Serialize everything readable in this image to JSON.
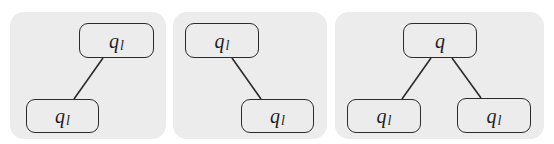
{
  "diagram": {
    "colors": {
      "panel_background": "#ececec",
      "node_border": "#2b2b2b",
      "text": "#1e1e1e"
    },
    "panels": [
      {
        "id": "panel-1",
        "box": {
          "x": 10,
          "y": 12,
          "w": 156,
          "h": 127
        },
        "nodes": [
          {
            "id": "p1-root",
            "base": "q",
            "sub": "l",
            "x": 69,
            "y": 11,
            "w": 75,
            "h": 35
          },
          {
            "id": "p1-child",
            "base": "q",
            "sub": "l",
            "x": 16,
            "y": 87,
            "w": 73,
            "h": 34
          }
        ],
        "edges": [
          {
            "from": "p1-root",
            "to": "p1-child",
            "x1": 93,
            "y1": 46,
            "x2": 64,
            "y2": 87
          }
        ]
      },
      {
        "id": "panel-2",
        "box": {
          "x": 173,
          "y": 12,
          "w": 154,
          "h": 127
        },
        "nodes": [
          {
            "id": "p2-root",
            "base": "q",
            "sub": "l",
            "x": 12,
            "y": 11,
            "w": 74,
            "h": 35
          },
          {
            "id": "p2-child",
            "base": "q",
            "sub": "l",
            "x": 68,
            "y": 87,
            "w": 73,
            "h": 34
          }
        ],
        "edges": [
          {
            "from": "p2-root",
            "to": "p2-child",
            "x1": 59,
            "y1": 46,
            "x2": 88,
            "y2": 87
          }
        ]
      },
      {
        "id": "panel-3",
        "box": {
          "x": 335,
          "y": 12,
          "w": 209,
          "h": 127
        },
        "nodes": [
          {
            "id": "p3-root",
            "base": "q",
            "sub": "",
            "x": 68,
            "y": 11,
            "w": 74,
            "h": 35
          },
          {
            "id": "p3-left",
            "base": "q",
            "sub": "l",
            "x": 12,
            "y": 87,
            "w": 74,
            "h": 34
          },
          {
            "id": "p3-right",
            "base": "q",
            "sub": "l",
            "x": 122,
            "y": 86,
            "w": 74,
            "h": 35
          }
        ],
        "edges": [
          {
            "from": "p3-root",
            "to": "p3-left",
            "x1": 96,
            "y1": 46,
            "x2": 67,
            "y2": 87
          },
          {
            "from": "p3-root",
            "to": "p3-right",
            "x1": 117,
            "y1": 46,
            "x2": 146,
            "y2": 86
          }
        ]
      }
    ]
  }
}
